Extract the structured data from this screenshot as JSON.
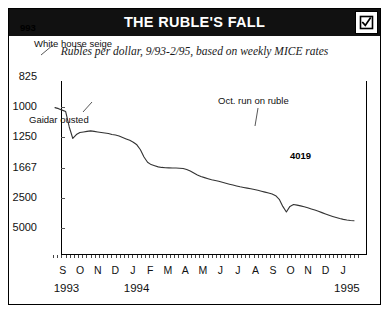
{
  "header": {
    "title": "THE RUBLE'S FALL",
    "checkbox_icon": "checked-checkbox-icon",
    "checkbox_checked": true,
    "bar_color": "#111111",
    "title_color": "#ffffff"
  },
  "subtitle": "Rubles per dollar, 9/93-2/95, based on weekly MICE rates",
  "chart_data": {
    "type": "line",
    "title": "THE RUBLE'S FALL",
    "subtitle": "Rubles per dollar, 9/93-2/95, based on weekly MICE rates",
    "xlabel": "",
    "ylabel": "Rubles per dollar",
    "y_scale": "reciprocal-inverted",
    "y_ticks": [
      825,
      1000,
      1250,
      1667,
      2500,
      5000
    ],
    "y_tick_labels": [
      "825",
      "1000",
      "1250",
      "1667",
      "2500",
      "5000"
    ],
    "ylim": [
      825,
      5000
    ],
    "grid": false,
    "legend": false,
    "x_tick_labels": [
      "S",
      "O",
      "N",
      "D",
      "J",
      "F",
      "M",
      "A",
      "M",
      "J",
      "J",
      "A",
      "S",
      "O",
      "N",
      "D",
      "J"
    ],
    "x_year_labels": [
      {
        "label": "1993",
        "month_index": 0
      },
      {
        "label": "1994",
        "month_index": 4
      },
      {
        "label": "1995",
        "month_index": 16
      }
    ],
    "line_color": "#333333",
    "start_value_label": "993",
    "end_value_label": "4019",
    "annotations": [
      {
        "text": "White house seige",
        "event_month": "Oct 1993"
      },
      {
        "text": "Gaidar ousted",
        "event_month": "Jan 1994"
      },
      {
        "text": "Oct. run on ruble",
        "event_month": "Oct 1994"
      }
    ],
    "series": [
      {
        "name": "Rubles per dollar",
        "values": [
          993,
          1000,
          1010,
          1020,
          1140,
          1250,
          1210,
          1190,
          1185,
          1180,
          1175,
          1180,
          1185,
          1190,
          1195,
          1200,
          1210,
          1215,
          1225,
          1240,
          1255,
          1270,
          1290,
          1320,
          1380,
          1480,
          1560,
          1600,
          1620,
          1640,
          1650,
          1655,
          1658,
          1660,
          1662,
          1665,
          1670,
          1690,
          1720,
          1760,
          1800,
          1835,
          1860,
          1885,
          1910,
          1930,
          1950,
          1975,
          2000,
          2025,
          2050,
          2075,
          2100,
          2120,
          2140,
          2160,
          2185,
          2210,
          2240,
          2270,
          2300,
          2340,
          2400,
          2550,
          2900,
          3250,
          2900,
          2800,
          2830,
          2870,
          2920,
          2980,
          3050,
          3120,
          3200,
          3300,
          3400,
          3500,
          3600,
          3700,
          3800,
          3880,
          3940,
          3990,
          4019
        ],
        "x": [
          "9/93",
          "9/93",
          "9/93",
          "10/93",
          "10/93",
          "10/93",
          "10/93",
          "11/93",
          "11/93",
          "11/93",
          "11/93",
          "12/93",
          "12/93",
          "12/93",
          "12/93",
          "1/94",
          "1/94",
          "1/94",
          "1/94",
          "2/94",
          "2/94",
          "2/94",
          "2/94",
          "3/94",
          "3/94",
          "3/94",
          "3/94",
          "4/94",
          "4/94",
          "4/94",
          "4/94",
          "5/94",
          "5/94",
          "5/94",
          "5/94",
          "6/94",
          "6/94",
          "6/94",
          "6/94",
          "7/94",
          "7/94",
          "7/94",
          "7/94",
          "8/94",
          "8/94",
          "8/94",
          "8/94",
          "9/94",
          "9/94",
          "9/94",
          "9/94",
          "10/94",
          "10/94",
          "10/94",
          "10/94",
          "10/94",
          "10/94",
          "10/94",
          "11/94",
          "11/94",
          "11/94",
          "11/94",
          "11/94",
          "11/94",
          "11/94",
          "10/94",
          "11/94",
          "11/94",
          "11/94",
          "12/94",
          "12/94",
          "12/94",
          "12/94",
          "12/94",
          "1/95",
          "1/95",
          "1/95",
          "1/95",
          "1/95",
          "2/95",
          "2/95",
          "2/95",
          "2/95",
          "2/95",
          "2/95"
        ]
      }
    ]
  }
}
